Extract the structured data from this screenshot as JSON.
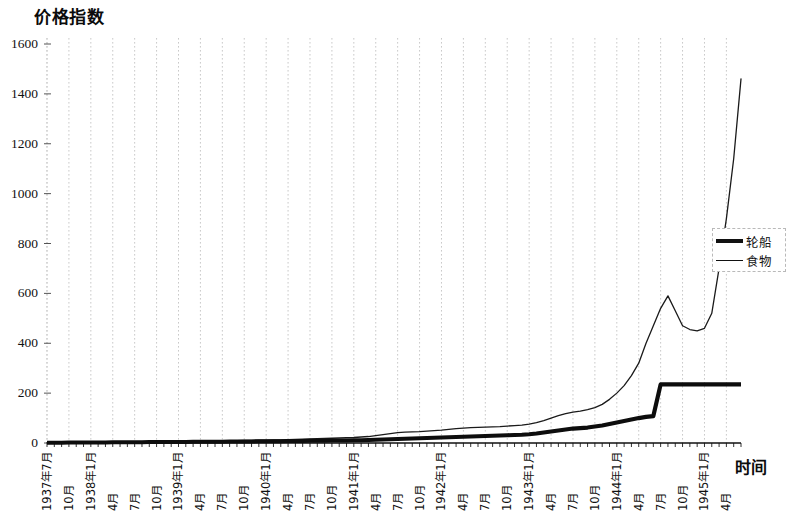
{
  "chart_data": {
    "type": "line",
    "title": "价格指数",
    "xlabel": "时间",
    "ylabel": "",
    "ylim": [
      0,
      1600
    ],
    "yticks": [
      0,
      200,
      400,
      600,
      800,
      1000,
      1200,
      1400,
      1600
    ],
    "grid": "vertical-dashed",
    "legend_position": "right-middle",
    "categories": [
      "1937年7月",
      "8月",
      "9月",
      "10月",
      "11月",
      "12月",
      "1938年1月",
      "2月",
      "3月",
      "4月",
      "5月",
      "6月",
      "7月",
      "8月",
      "9月",
      "10月",
      "11月",
      "12月",
      "1939年1月",
      "2月",
      "3月",
      "4月",
      "5月",
      "6月",
      "7月",
      "8月",
      "9月",
      "10月",
      "11月",
      "12月",
      "1940年1月",
      "2月",
      "3月",
      "4月",
      "5月",
      "6月",
      "7月",
      "8月",
      "9月",
      "10月",
      "11月",
      "12月",
      "1941年1月",
      "2月",
      "3月",
      "4月",
      "5月",
      "6月",
      "7月",
      "8月",
      "9月",
      "10月",
      "11月",
      "12月",
      "1942年1月",
      "2月",
      "3月",
      "4月",
      "5月",
      "6月",
      "7月",
      "8月",
      "9月",
      "10月",
      "11月",
      "12月",
      "1943年1月",
      "2月",
      "3月",
      "4月",
      "5月",
      "6月",
      "7月",
      "8月",
      "9月",
      "10月",
      "11月",
      "12月",
      "1944年1月",
      "2月",
      "3月",
      "4月",
      "5月",
      "6月",
      "7月",
      "8月",
      "9月",
      "10月",
      "11月",
      "12月",
      "1945年1月",
      "2月",
      "3月",
      "4月",
      "5月",
      "6月"
    ],
    "xtick_labels": [
      {
        "index": 0,
        "label": "1937年7月"
      },
      {
        "index": 3,
        "label": "10月"
      },
      {
        "index": 6,
        "label": "1938年1月"
      },
      {
        "index": 9,
        "label": "4月"
      },
      {
        "index": 12,
        "label": "7月"
      },
      {
        "index": 15,
        "label": "10月"
      },
      {
        "index": 18,
        "label": "1939年1月"
      },
      {
        "index": 21,
        "label": "4月"
      },
      {
        "index": 24,
        "label": "7月"
      },
      {
        "index": 27,
        "label": "10月"
      },
      {
        "index": 30,
        "label": "1940年1月"
      },
      {
        "index": 33,
        "label": "4月"
      },
      {
        "index": 36,
        "label": "7月"
      },
      {
        "index": 39,
        "label": "10月"
      },
      {
        "index": 42,
        "label": "1941年1月"
      },
      {
        "index": 45,
        "label": "4月"
      },
      {
        "index": 48,
        "label": "7月"
      },
      {
        "index": 51,
        "label": "10月"
      },
      {
        "index": 54,
        "label": "1942年1月"
      },
      {
        "index": 57,
        "label": "4月"
      },
      {
        "index": 60,
        "label": "7月"
      },
      {
        "index": 63,
        "label": "10月"
      },
      {
        "index": 66,
        "label": "1943年1月"
      },
      {
        "index": 69,
        "label": "4月"
      },
      {
        "index": 72,
        "label": "7月"
      },
      {
        "index": 75,
        "label": "10月"
      },
      {
        "index": 78,
        "label": "1944年1月"
      },
      {
        "index": 81,
        "label": "4月"
      },
      {
        "index": 84,
        "label": "7月"
      },
      {
        "index": 87,
        "label": "10月"
      },
      {
        "index": 90,
        "label": "1945年1月"
      },
      {
        "index": 93,
        "label": "4月"
      }
    ],
    "series": [
      {
        "name": "轮船",
        "style": "thick",
        "values": [
          1,
          1,
          1,
          2,
          2,
          2,
          2,
          2,
          2,
          3,
          3,
          3,
          3,
          3,
          4,
          4,
          4,
          4,
          4,
          4,
          5,
          5,
          5,
          5,
          5,
          6,
          6,
          6,
          6,
          7,
          7,
          7,
          7,
          8,
          8,
          8,
          9,
          9,
          9,
          10,
          10,
          10,
          11,
          11,
          12,
          13,
          14,
          15,
          16,
          17,
          18,
          19,
          20,
          21,
          22,
          23,
          24,
          25,
          26,
          27,
          28,
          29,
          30,
          31,
          32,
          33,
          35,
          38,
          42,
          46,
          50,
          54,
          58,
          60,
          62,
          66,
          70,
          76,
          82,
          88,
          94,
          100,
          105,
          108,
          235,
          235,
          235,
          235,
          235,
          235,
          235,
          235,
          235,
          235,
          235,
          235
        ]
      },
      {
        "name": "食物",
        "style": "thin",
        "values": [
          1,
          1,
          1,
          2,
          2,
          2,
          2,
          3,
          3,
          3,
          3,
          4,
          4,
          4,
          5,
          5,
          5,
          5,
          6,
          6,
          6,
          7,
          7,
          8,
          8,
          9,
          9,
          10,
          10,
          11,
          11,
          12,
          12,
          13,
          14,
          15,
          16,
          17,
          18,
          19,
          20,
          21,
          22,
          24,
          26,
          30,
          34,
          38,
          42,
          44,
          45,
          46,
          48,
          50,
          52,
          55,
          58,
          60,
          62,
          63,
          64,
          65,
          66,
          68,
          70,
          72,
          76,
          82,
          90,
          100,
          110,
          118,
          124,
          128,
          134,
          142,
          155,
          175,
          200,
          230,
          270,
          320,
          400,
          470,
          540,
          590,
          530,
          470,
          455,
          450,
          460,
          520,
          700,
          900,
          1140,
          1460
        ]
      }
    ]
  },
  "legend": {
    "items": [
      {
        "label": "轮船"
      },
      {
        "label": "食物"
      }
    ]
  },
  "axis": {
    "y_labels": [
      "1600",
      "1400",
      "1200",
      "1000",
      "800",
      "600",
      "400",
      "200",
      "0"
    ],
    "x_title": "时间"
  }
}
